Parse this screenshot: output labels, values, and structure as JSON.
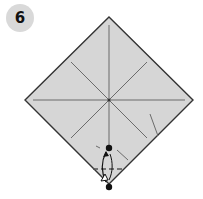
{
  "step": {
    "number": "6"
  },
  "diagram": {
    "paper_color": "#d6d6d6",
    "edge_color": "#333333",
    "crease_color": "#6b6b6b",
    "dot_color": "#111111",
    "diamond": {
      "top": [
        109,
        17
      ],
      "right": [
        193,
        100
      ],
      "bottom": [
        109,
        184
      ],
      "left": [
        25,
        100
      ]
    },
    "center": [
      109,
      100
    ],
    "fold_target_dot": [
      109,
      148
    ],
    "fold_corner_dot": [
      109,
      187
    ],
    "valley_fold_line_y": 169,
    "arrow": "fold-bottom-corner-up-to-dot"
  }
}
